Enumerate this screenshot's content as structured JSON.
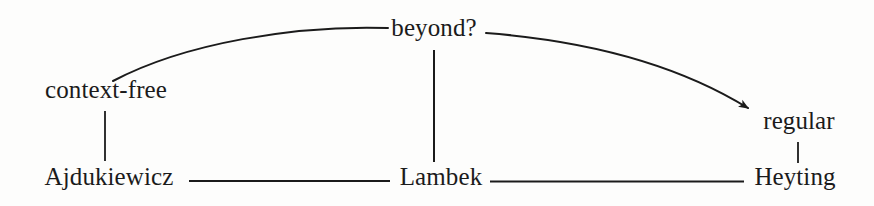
{
  "figure": {
    "type": "hierarchy-diagram",
    "background_color": "#fdfdfc",
    "ink_color": "#1b1b1b",
    "width": 874,
    "height": 206
  },
  "nodes": [
    {
      "id": "beyond",
      "label": "beyond?",
      "x": 434,
      "y": 40,
      "row": "top"
    },
    {
      "id": "context-free",
      "label": "context-free",
      "x": 106,
      "y": 102,
      "row": "upper-middle"
    },
    {
      "id": "regular",
      "label": "regular",
      "x": 799,
      "y": 133,
      "row": "lower-middle"
    },
    {
      "id": "ajdukiewicz",
      "label": "Ajdukiewicz",
      "x": 109,
      "y": 189,
      "row": "bottom"
    },
    {
      "id": "lambek",
      "label": "Lambek",
      "x": 441,
      "y": 189,
      "row": "bottom"
    },
    {
      "id": "heyting",
      "label": "Heyting",
      "x": 795,
      "y": 189,
      "row": "bottom"
    }
  ],
  "edges": [
    {
      "id": "edge-context-free-ajdukiewicz",
      "from": "context-free",
      "to": "ajdukiewicz",
      "style": "straight-vertical",
      "arrow": false
    },
    {
      "id": "edge-beyond-lambek",
      "from": "beyond",
      "to": "lambek",
      "style": "straight-vertical",
      "arrow": false
    },
    {
      "id": "edge-regular-heyting",
      "from": "regular",
      "to": "heyting",
      "style": "straight-vertical",
      "arrow": false
    },
    {
      "id": "edge-ajdukiewicz-lambek",
      "from": "ajdukiewicz",
      "to": "lambek",
      "style": "straight-horizontal",
      "arrow": false
    },
    {
      "id": "edge-lambek-heyting",
      "from": "lambek",
      "to": "heyting",
      "style": "straight-horizontal",
      "arrow": false
    },
    {
      "id": "edge-context-free-beyond",
      "from": "context-free",
      "to": "beyond",
      "style": "curve",
      "arrow": false
    },
    {
      "id": "edge-beyond-regular",
      "from": "beyond",
      "to": "regular",
      "style": "curve",
      "arrow": true
    }
  ]
}
